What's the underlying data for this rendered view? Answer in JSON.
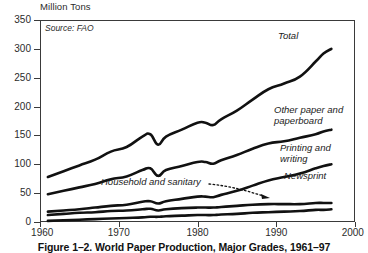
{
  "figure": {
    "caption": "Figure 1–2. World Paper Production, Major Grades, 1961–97",
    "source_note": "Source: FAO",
    "unit_label": "Million Tons"
  },
  "annotations": {
    "total": "Total",
    "other_paper": "Other paper and\npaperboard",
    "printing": "Printing and\nwriting",
    "newsprint": "Newsprint",
    "household": "Household and sanitary"
  },
  "axes": {
    "y_ticks": [
      "0",
      "50",
      "100",
      "150",
      "200",
      "250",
      "300",
      "350"
    ],
    "x_ticks": [
      "1960",
      "1970",
      "1980",
      "1990",
      "2000"
    ]
  },
  "chart_data": {
    "type": "line",
    "title": "Figure 1–2. World Paper Production, Major Grades, 1961–97",
    "subtitle": "Source: FAO",
    "xlabel": "",
    "ylabel": "Million Tons",
    "xlim": [
      1960,
      2000
    ],
    "ylim": [
      0,
      350
    ],
    "xticks": [
      1960,
      1970,
      1980,
      1990,
      2000
    ],
    "yticks": [
      0,
      50,
      100,
      150,
      200,
      250,
      300,
      350
    ],
    "grid": false,
    "legend": "inline-annotations",
    "line_color": "#111111",
    "x": [
      1961,
      1963,
      1965,
      1967,
      1969,
      1971,
      1973,
      1974,
      1975,
      1976,
      1978,
      1980,
      1981,
      1982,
      1983,
      1985,
      1987,
      1989,
      1991,
      1993,
      1995,
      1996,
      1997
    ],
    "series": [
      {
        "name": "Total",
        "values": [
          78,
          88,
          98,
          108,
          122,
          130,
          148,
          152,
          134,
          148,
          160,
          172,
          172,
          168,
          178,
          193,
          212,
          230,
          240,
          252,
          278,
          292,
          300
        ]
      },
      {
        "name": "Other paper and paperboard",
        "values": [
          48,
          54,
          60,
          66,
          74,
          79,
          90,
          93,
          80,
          90,
          97,
          104,
          104,
          101,
          107,
          116,
          127,
          136,
          140,
          146,
          152,
          157,
          160
        ]
      },
      {
        "name": "Printing and writing",
        "values": [
          18,
          20,
          22,
          25,
          28,
          30,
          35,
          36,
          32,
          36,
          40,
          44,
          44,
          43,
          47,
          54,
          63,
          72,
          78,
          84,
          93,
          97,
          100
        ]
      },
      {
        "name": "Newsprint",
        "values": [
          12,
          14,
          16,
          17,
          19,
          20,
          22,
          23,
          20,
          22,
          24,
          25,
          25,
          25,
          26,
          28,
          30,
          31,
          31,
          31,
          33,
          33,
          33
        ]
      },
      {
        "name": "Household and sanitary",
        "values": [
          2,
          3,
          4,
          5,
          6,
          7,
          8,
          9,
          9,
          10,
          11,
          12,
          12,
          12,
          13,
          14,
          16,
          17,
          18,
          19,
          21,
          21,
          22
        ]
      }
    ]
  }
}
